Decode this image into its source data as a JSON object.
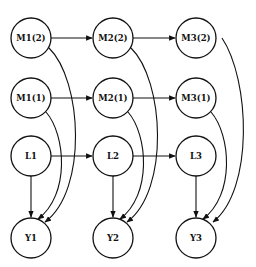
{
  "diagram": {
    "type": "directed-graph",
    "nodes": [
      {
        "id": "M1_2",
        "label": "M1(2)",
        "x": 31,
        "y": 38
      },
      {
        "id": "M2_2",
        "label": "M2(2)",
        "x": 113,
        "y": 38
      },
      {
        "id": "M3_2",
        "label": "M3(2)",
        "x": 196,
        "y": 38
      },
      {
        "id": "M1_1",
        "label": "M1(1)",
        "x": 31,
        "y": 98
      },
      {
        "id": "M2_1",
        "label": "M2(1)",
        "x": 113,
        "y": 98
      },
      {
        "id": "M3_1",
        "label": "M3(1)",
        "x": 196,
        "y": 98
      },
      {
        "id": "L1",
        "label": "L1",
        "x": 31,
        "y": 156
      },
      {
        "id": "L2",
        "label": "L2",
        "x": 113,
        "y": 156
      },
      {
        "id": "L3",
        "label": "L3",
        "x": 196,
        "y": 156
      },
      {
        "id": "Y1",
        "label": "Y1",
        "x": 31,
        "y": 238
      },
      {
        "id": "Y2",
        "label": "Y2",
        "x": 113,
        "y": 238
      },
      {
        "id": "Y3",
        "label": "Y3",
        "x": 196,
        "y": 238
      }
    ],
    "edges": [
      {
        "from": "M1_2",
        "to": "M2_2",
        "kind": "straight"
      },
      {
        "from": "M2_2",
        "to": "M3_2",
        "kind": "straight"
      },
      {
        "from": "M1_1",
        "to": "M2_1",
        "kind": "straight"
      },
      {
        "from": "M2_1",
        "to": "M3_1",
        "kind": "straight"
      },
      {
        "from": "L1",
        "to": "L2",
        "kind": "straight"
      },
      {
        "from": "L2",
        "to": "L3",
        "kind": "straight"
      },
      {
        "from": "L1",
        "to": "Y1",
        "kind": "straight"
      },
      {
        "from": "L2",
        "to": "Y2",
        "kind": "straight"
      },
      {
        "from": "L3",
        "to": "Y3",
        "kind": "straight"
      },
      {
        "from": "M1_1",
        "to": "Y1",
        "kind": "curved"
      },
      {
        "from": "M1_2",
        "to": "Y1",
        "kind": "curved"
      },
      {
        "from": "M2_1",
        "to": "Y2",
        "kind": "curved"
      },
      {
        "from": "M2_2",
        "to": "Y2",
        "kind": "curved"
      },
      {
        "from": "M3_1",
        "to": "Y3",
        "kind": "curved"
      },
      {
        "from": "M3_2",
        "to": "Y3",
        "kind": "curved"
      }
    ]
  }
}
